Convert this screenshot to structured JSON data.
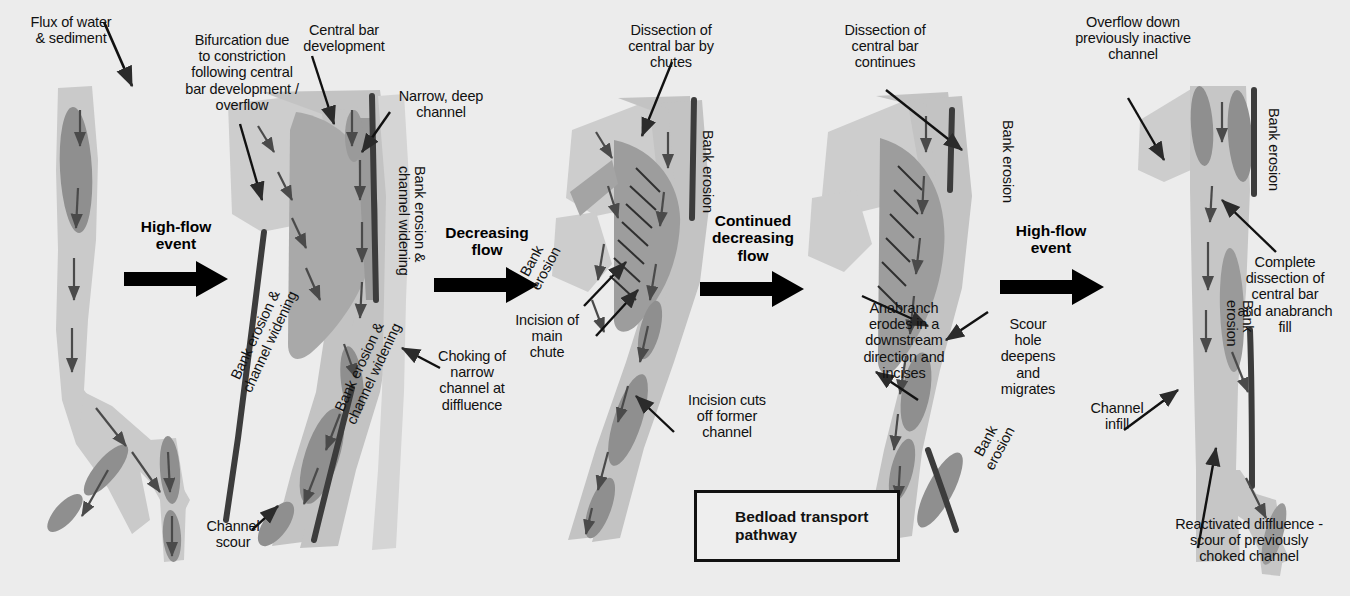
{
  "figure": {
    "background_color": "#ececec",
    "palette": {
      "background": "#ececec",
      "channel_light": "#cccccc",
      "channel_mid": "#b4b4b4",
      "bar_medium": "#a8a8a8",
      "scour_dark": "#8c8c8c",
      "erosion_line": "#3a3a3a",
      "text": "#111111",
      "arrow": "#2b2b2b"
    }
  },
  "legend": {
    "icon": "down-arrow-icon",
    "text": "Bedload transport\npathway"
  },
  "transitions": [
    {
      "id": "t1",
      "label": "High-flow\nevent"
    },
    {
      "id": "t2",
      "label": "Decreasing\nflow"
    },
    {
      "id": "t3",
      "label": "Continued\ndecreasing\nflow"
    },
    {
      "id": "t4",
      "label": "High-flow\nevent"
    }
  ],
  "panels": [
    {
      "id": "panel-1",
      "index": 1,
      "stage_name": "initial-single-thread-channel",
      "annotations": [
        {
          "id": "a1-1",
          "text": "Flux of water\n& sediment"
        }
      ]
    },
    {
      "id": "panel-2",
      "index": 2,
      "stage_name": "bifurcation-and-central-bar",
      "annotations": [
        {
          "id": "a2-1",
          "text": "Bifurcation due\nto constriction\nfollowing central\nbar development /\noverflow"
        },
        {
          "id": "a2-2",
          "text": "Central bar\ndevelopment"
        },
        {
          "id": "a2-3",
          "text": "Narrow, deep\nchannel"
        },
        {
          "id": "a2-4",
          "text": "Bank erosion &\nchannel widening"
        },
        {
          "id": "a2-5",
          "text": "Choking of\nnarrow\nchannel at\ndiffluence"
        },
        {
          "id": "a2-6",
          "text": "Bank erosion &\nchannel widening"
        },
        {
          "id": "a2-7",
          "text": "Bank erosion &\nchannel widening"
        },
        {
          "id": "a2-8",
          "text": "Channel\nscour"
        }
      ]
    },
    {
      "id": "panel-3",
      "index": 3,
      "stage_name": "dissection-by-chutes",
      "annotations": [
        {
          "id": "a3-1",
          "text": "Dissection of\ncentral bar by\nchutes"
        },
        {
          "id": "a3-2",
          "text": "Bank erosion"
        },
        {
          "id": "a3-3",
          "text": "Bank\nerosion"
        },
        {
          "id": "a3-4",
          "text": "Incision of\nmain\nchute"
        },
        {
          "id": "a3-5",
          "text": "Incision cuts\noff former\nchannel"
        }
      ]
    },
    {
      "id": "panel-4",
      "index": 4,
      "stage_name": "continued-dissection-and-scour-migration",
      "annotations": [
        {
          "id": "a4-1",
          "text": "Dissection of\ncentral bar\ncontinues"
        },
        {
          "id": "a4-2",
          "text": "Bank erosion"
        },
        {
          "id": "a4-3",
          "text": "Anabranch\nerodes in a\ndownstream\ndirection and\nincises"
        },
        {
          "id": "a4-4",
          "text": "Scour\nhole\ndeepens\nand\nmigrates"
        },
        {
          "id": "a4-5",
          "text": "Bank\nerosion"
        }
      ]
    },
    {
      "id": "panel-5",
      "index": 5,
      "stage_name": "reactivated-diffluence-and-infill",
      "annotations": [
        {
          "id": "a5-1",
          "text": "Overflow down\npreviously inactive\nchannel"
        },
        {
          "id": "a5-2",
          "text": "Bank erosion"
        },
        {
          "id": "a5-3",
          "text": "Complete\ndissection of\ncentral bar\nand anabranch\nfill"
        },
        {
          "id": "a5-4",
          "text": "Bank\nerosion"
        },
        {
          "id": "a5-5",
          "text": "Channel\ninfill"
        },
        {
          "id": "a5-6",
          "text": "Reactivated diffluence -\nscour of previously\nchoked channel"
        }
      ]
    }
  ]
}
